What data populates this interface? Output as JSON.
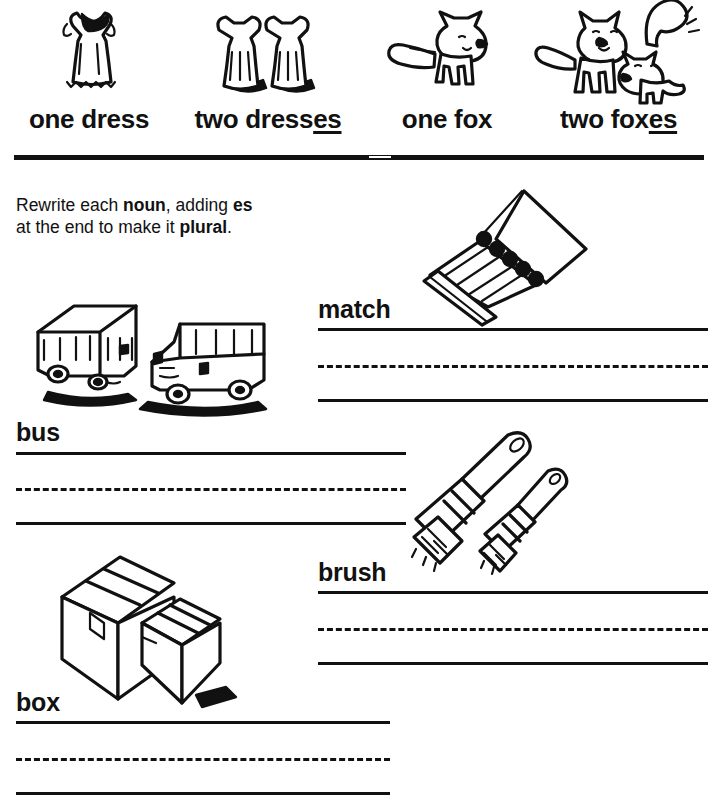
{
  "worksheet": {
    "instruction_html": "Rewrite each <b>noun</b>, adding <b>es</b><br>at the end to make it <b>plural</b>.",
    "instruction_text": "Rewrite each noun, adding es at the end to make it plural."
  },
  "examples": [
    {
      "id": "one-dress",
      "caption_prefix": "one dress",
      "caption_suffix": "",
      "art": "dress-single-illustration"
    },
    {
      "id": "two-dresses",
      "caption_prefix": "two dress",
      "caption_suffix": "es",
      "art": "dress-pair-illustration"
    },
    {
      "id": "one-fox",
      "caption_prefix": "one fox",
      "caption_suffix": "",
      "art": "fox-single-illustration"
    },
    {
      "id": "two-foxes",
      "caption_prefix": "two fox",
      "caption_suffix": "es",
      "art": "fox-pair-illustration"
    }
  ],
  "exercises": [
    {
      "id": "bus",
      "word": "bus",
      "art": "buses-illustration"
    },
    {
      "id": "match",
      "word": "match",
      "art": "matchbook-illustration"
    },
    {
      "id": "brush",
      "word": "brush",
      "art": "brushes-illustration"
    },
    {
      "id": "box",
      "word": "box",
      "art": "boxes-illustration"
    }
  ],
  "colors": {
    "ink": "#111111",
    "paper": "#ffffff"
  }
}
